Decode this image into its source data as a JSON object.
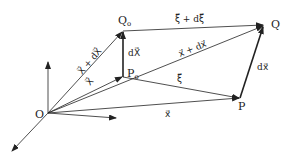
{
  "diagram": {
    "title": "",
    "colors": {
      "line": "#222222",
      "background": "#ffffff"
    },
    "points": {
      "O": {
        "label": "O"
      },
      "P0": {
        "label": "P",
        "sub": "o"
      },
      "Q0": {
        "label": "Q",
        "sub": "o"
      },
      "P": {
        "label": "P"
      },
      "Q": {
        "label": "Q"
      }
    },
    "vectors": {
      "X": {
        "label": "X⃗",
        "from": "O",
        "to": "P0"
      },
      "X_plus_dX": {
        "label": "X⃗ + dX⃗",
        "from": "O",
        "to": "Q0"
      },
      "dX": {
        "label": "dX⃗",
        "from": "P0",
        "to": "Q0"
      },
      "x": {
        "label": "x⃗",
        "from": "O",
        "to": "P"
      },
      "x_plus_dx": {
        "label": "x⃗ + dx⃗",
        "from": "O",
        "to": "Q"
      },
      "dx": {
        "label": "dx⃗",
        "from": "P",
        "to": "Q"
      },
      "xi": {
        "label": "ξ⃗",
        "from": "P0",
        "to": "P"
      },
      "xi_plus_dxi": {
        "label": "ξ⃗ + dξ⃗",
        "from": "Q0",
        "to": "Q"
      }
    },
    "axes": [
      "up",
      "right",
      "down-left"
    ]
  }
}
